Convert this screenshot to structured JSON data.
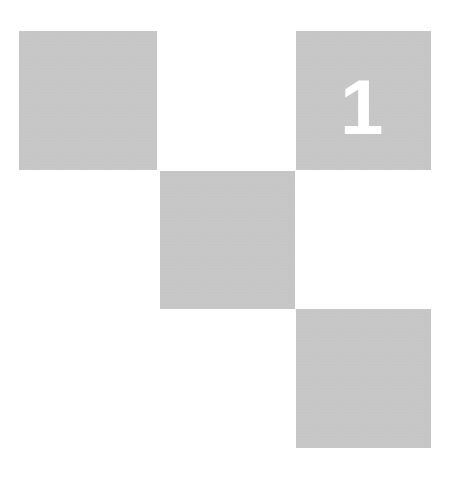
{
  "grid": {
    "background": "#ffffff",
    "tile_color": "#dcdcdc",
    "tiles": [
      {
        "id": "tile-1",
        "row": 1,
        "col": 1,
        "label": ""
      },
      {
        "id": "tile-2",
        "row": 2,
        "col": 2,
        "label": ""
      },
      {
        "id": "tile-3",
        "row": 1,
        "col": 3,
        "label": "1"
      },
      {
        "id": "tile-4",
        "row": 3,
        "col": 3,
        "label": ""
      }
    ]
  }
}
